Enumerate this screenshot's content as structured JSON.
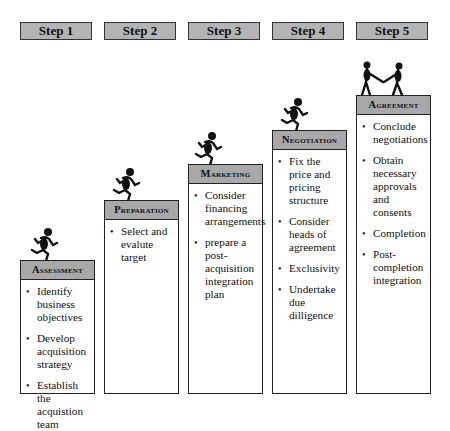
{
  "steps": [
    {
      "label": "Step 1"
    },
    {
      "label": "Step 2"
    },
    {
      "label": "Step 3"
    },
    {
      "label": "Step 4"
    },
    {
      "label": "Step 5"
    }
  ],
  "stages": [
    {
      "title": "Assessment",
      "figure": "running-figure-icon",
      "items": [
        "Identify business objectives",
        "Develop acquisition strategy",
        "Establish the acquistion team"
      ]
    },
    {
      "title": "Preparation",
      "figure": "running-figure-icon",
      "items": [
        "Select and evalute target"
      ]
    },
    {
      "title": "Marketing",
      "figure": "running-figure-icon",
      "items": [
        "Consider financing arrangements",
        "prepare a post-acquisition integration plan"
      ]
    },
    {
      "title": "Negotiation",
      "figure": "running-figure-icon",
      "items": [
        "Fix the price and pricing structure",
        "Consider heads of agreement",
        "Exclusivity",
        "Undertake due dilligence"
      ]
    },
    {
      "title": "Agreement",
      "figure": "handshake-figures-icon",
      "items": [
        "Conclude negotiations",
        "Obtain necessary approvals and consents",
        "Completion",
        "Post-completion integration"
      ]
    }
  ],
  "colors": {
    "tab_fill": "#b4b4b4",
    "header_fill": "#a8a8a8",
    "border": "#222222"
  }
}
